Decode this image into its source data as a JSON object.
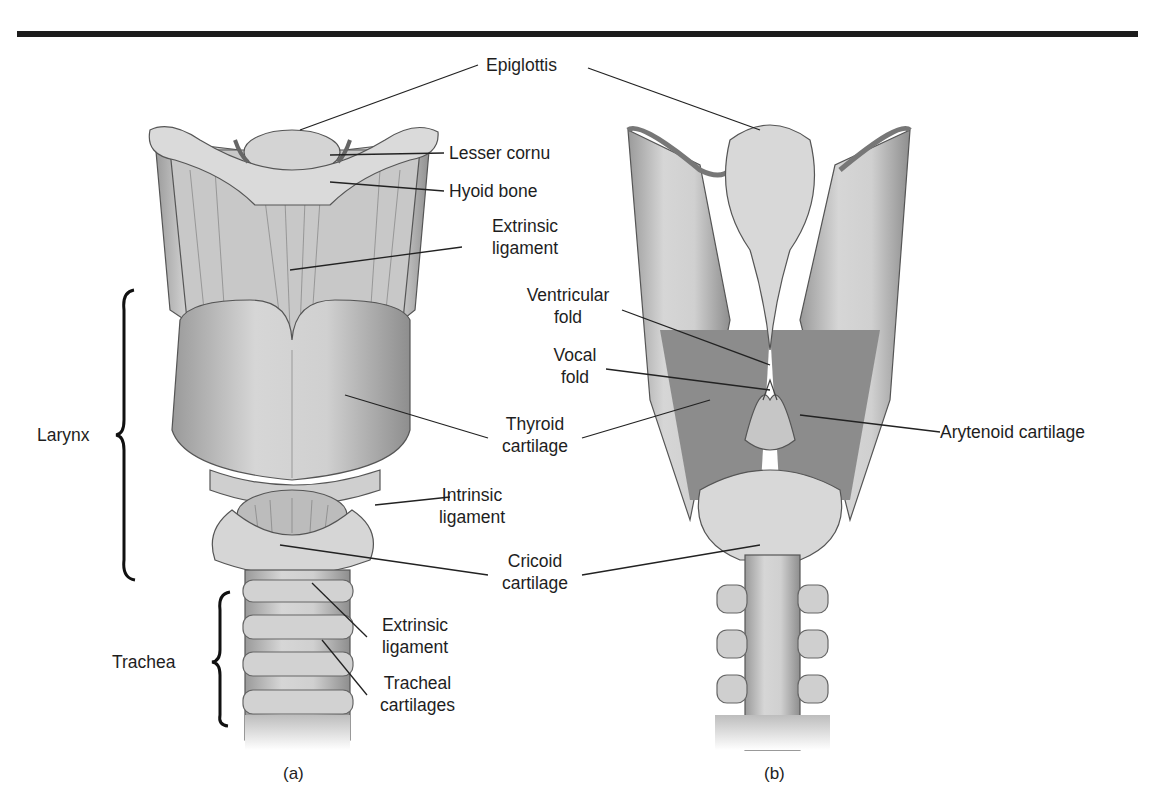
{
  "figure": {
    "panels": [
      {
        "id": "a",
        "caption": "(a)",
        "view": "anterior"
      },
      {
        "id": "b",
        "caption": "(b)",
        "view": "posterior"
      }
    ],
    "labels": {
      "epiglottis": "Epiglottis",
      "lesser_cornu": "Lesser cornu",
      "hyoid_bone": "Hyoid bone",
      "extrinsic_ligament_upper": [
        "Extrinsic",
        "ligament"
      ],
      "ventricular_fold": [
        "Ventricular",
        "fold"
      ],
      "vocal_fold": [
        "Vocal",
        "fold"
      ],
      "thyroid_cartilage": [
        "Thyroid",
        "cartilage"
      ],
      "arytenoid_cartilage": "Arytenoid cartilage",
      "intrinsic_ligament": [
        "Intrinsic",
        "ligament"
      ],
      "cricoid_cartilage": [
        "Cricoid",
        "cartilage"
      ],
      "extrinsic_ligament_lower": [
        "Extrinsic",
        "ligament"
      ],
      "tracheal_cartilages": [
        "Tracheal",
        "cartilages"
      ],
      "larynx": "Larynx",
      "trachea": "Trachea"
    }
  }
}
